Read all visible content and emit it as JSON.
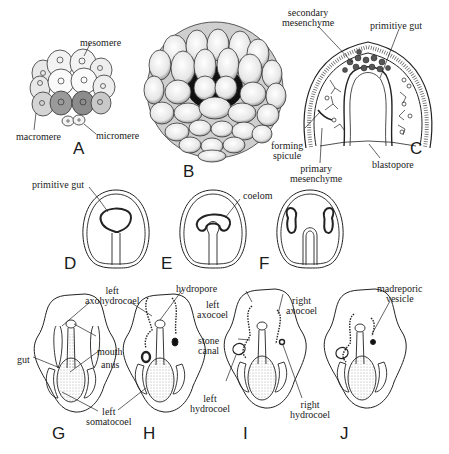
{
  "panels": {
    "A": {
      "letter": "A",
      "labels": {
        "mesomere": "mesomere",
        "macromere": "macromere",
        "micromere": "micromere"
      }
    },
    "B": {
      "letter": "B"
    },
    "C": {
      "letter": "C",
      "labels": {
        "secondary_mesenchyme_1": "secondary",
        "secondary_mesenchyme_2": "mesenchyme",
        "primitive_gut": "primitive gut",
        "forming_spicule_1": "forming",
        "forming_spicule_2": "spicule",
        "primary_mesenchyme_1": "primary",
        "primary_mesenchyme_2": "mesenchyme",
        "blastopore": "blastopore"
      }
    },
    "D": {
      "letter": "D",
      "labels": {
        "primitive_gut": "primitive gut"
      }
    },
    "E": {
      "letter": "E",
      "labels": {
        "coelom": "coelom"
      }
    },
    "F": {
      "letter": "F"
    },
    "G": {
      "letter": "G",
      "labels": {
        "left_axohydrocoel_1": "left",
        "left_axohydrocoel_2": "axohydrocoel",
        "gut": "gut",
        "mouth": "mouth",
        "anus": "anus",
        "left_somatocoel_1": "left",
        "left_somatocoel_2": "somatocoel"
      }
    },
    "H": {
      "letter": "H",
      "labels": {
        "hydropore": "hydropore"
      }
    },
    "I": {
      "letter": "I",
      "labels": {
        "left_axocoel_1": "left",
        "left_axocoel_2": "axocoel",
        "right_axocoel_1": "right",
        "right_axocoel_2": "axocoel",
        "stone_canal_1": "stone",
        "stone_canal_2": "canal",
        "left_hydrocoel_1": "left",
        "left_hydrocoel_2": "hydrocoel",
        "right_hydrocoel_1": "right",
        "right_hydrocoel_2": "hydrocoel"
      }
    },
    "J": {
      "letter": "J",
      "labels": {
        "madreporic_vesicle_1": "madreporic",
        "madreporic_vesicle_2": "vesicle"
      }
    }
  }
}
